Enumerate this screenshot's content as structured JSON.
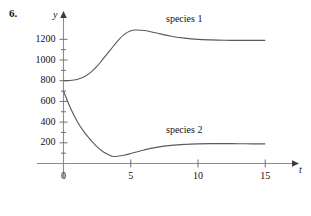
{
  "figure": {
    "problem_number": "6.",
    "y_axis_name": "y",
    "x_axis_name": "t"
  },
  "chart_data": {
    "type": "line",
    "title": "",
    "xlabel": "t",
    "ylabel": "y",
    "xlim": [
      0,
      16
    ],
    "ylim": [
      0,
      1320
    ],
    "grid": false,
    "legend": "inline-annotations",
    "x_ticks": [
      0,
      5,
      10,
      15
    ],
    "x_tick_labels": [
      "0",
      "5",
      "10",
      "15"
    ],
    "x_minor_tick_step": 5,
    "y_ticks": [
      200,
      400,
      600,
      800,
      1000,
      1200
    ],
    "y_tick_labels": [
      "200",
      "400",
      "600",
      "800",
      "1000",
      "1200"
    ],
    "y_minor_tick_step": 100,
    "annotations": [
      {
        "text": "species 1",
        "x": 7.6,
        "y": 1310
      },
      {
        "text": "species 2",
        "x": 7.6,
        "y": 370
      }
    ],
    "series": [
      {
        "name": "species 1",
        "color": "#5a5a5a",
        "initial_value": 800,
        "peak_value": 1290,
        "peak_x": 5.4,
        "asymptote": 1190,
        "x": [
          0,
          0.5,
          1,
          1.5,
          2,
          2.5,
          3,
          3.5,
          4,
          4.5,
          5,
          5.4,
          6,
          6.5,
          7,
          7.5,
          8,
          9,
          10,
          11,
          12,
          13,
          14,
          15
        ],
        "y": [
          800,
          802,
          812,
          835,
          878,
          940,
          1020,
          1100,
          1180,
          1245,
          1283,
          1290,
          1285,
          1273,
          1258,
          1243,
          1230,
          1211,
          1199,
          1194,
          1191,
          1190,
          1190,
          1190
        ]
      },
      {
        "name": "species 2",
        "color": "#5a5a5a",
        "initial_value": 700,
        "minimum_value": 68,
        "minimum_x": 3.7,
        "asymptote": 190,
        "x": [
          0,
          0.5,
          1,
          1.5,
          2,
          2.5,
          3,
          3.5,
          3.7,
          4,
          4.5,
          5,
          5.5,
          6,
          7,
          8,
          9,
          10,
          11,
          12,
          13,
          14,
          15
        ],
        "y": [
          700,
          540,
          410,
          310,
          230,
          160,
          108,
          76,
          68,
          70,
          80,
          96,
          114,
          131,
          158,
          175,
          185,
          190,
          192,
          192,
          191,
          190,
          190
        ]
      }
    ]
  }
}
